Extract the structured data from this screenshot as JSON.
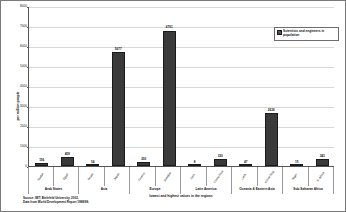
{
  "chart_data": {
    "type": "bar",
    "title": "",
    "xlabel": "lowest and highest values in the regions",
    "ylabel": "per million people",
    "ylim": [
      0,
      8000
    ],
    "ytick_values": [
      0,
      1000,
      2000,
      3000,
      4000,
      5000,
      6000,
      7000,
      8000
    ],
    "ytick_labels": [
      "0",
      "1000",
      "2000",
      "3000",
      "4000",
      "5000",
      "6000",
      "7000",
      "8000"
    ],
    "grid": true,
    "legend_position": "top-right",
    "legend": [
      "Scientists and engineers in population"
    ],
    "series": [
      {
        "name": "Scientists and engineers in population",
        "values": [
          156,
          459,
          54,
          5677,
          200,
          6761,
          8,
          330,
          47,
          2636,
          15,
          343
        ]
      }
    ],
    "categories": [
      "Sudan",
      "Egypt",
      "Nepal",
      "Japan",
      "Greece",
      "Sweden",
      "Haiti",
      "Costa Rica",
      "Laos",
      "Korea Rep.",
      "Niger",
      "S. Africa"
    ],
    "data_labels": [
      "156",
      "459",
      "54",
      "5677",
      "200",
      "6761",
      "8",
      "330",
      "47",
      "2636",
      "15",
      "343"
    ],
    "groups": [
      {
        "label": "Arab States",
        "span": 2
      },
      {
        "label": "Asia",
        "span": 2
      },
      {
        "label": "Europe",
        "span": 2
      },
      {
        "label": "Latin America",
        "span": 2
      },
      {
        "label": "Oceania & Eastern Asia",
        "span": 2
      },
      {
        "label": "Sub-Saharan Africa",
        "span": 2
      }
    ],
    "bar_color": "#3a3a3a",
    "notes": [
      "Source: IWT, Bielefeld University, 2002.",
      "Data from World Development Report 1998/99."
    ]
  },
  "legend": {
    "entry_label": "Scientists and engineers in population"
  },
  "footer": {
    "line1": "Source: IWT, Bielefeld University, 2002.",
    "line2": "Data from World Development Report 1998/99."
  },
  "axes": {
    "y_title": "per million people",
    "x_title": "lowest and highest values in the regions"
  }
}
